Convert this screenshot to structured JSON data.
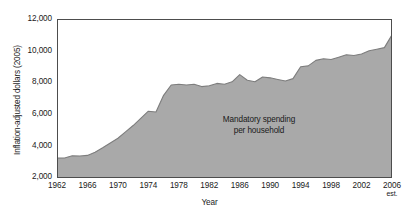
{
  "chart_data": {
    "type": "area",
    "title": "",
    "xlabel": "Year",
    "ylabel": "Inflation-adjusted dollars (2005)",
    "xlim": [
      1962,
      2006
    ],
    "ylim": [
      2000,
      12000
    ],
    "grid": false,
    "legend": "none",
    "fill_color": "#a9a9a9",
    "line_color": "#7d7d7d",
    "axis_color": "#4d4d4d",
    "background": "#ffffff",
    "yticks": [
      "12,000",
      "10,000",
      "8,000",
      "6,000",
      "4,000",
      "2,000"
    ],
    "ytick_values": [
      12000,
      10000,
      8000,
      6000,
      4000,
      2000
    ],
    "xticks": [
      "1962",
      "1966",
      "1970",
      "1974",
      "1978",
      "1982",
      "1986",
      "1990",
      "1994",
      "1998",
      "2002",
      "2006"
    ],
    "xtick_values": [
      1962,
      1966,
      1970,
      1974,
      1978,
      1982,
      1986,
      1990,
      1994,
      1998,
      2002,
      2006
    ],
    "xtick_last_note": "est.",
    "annotation": {
      "line1": "Mandatory spending",
      "line2": "per household"
    },
    "x": [
      1962,
      1963,
      1964,
      1965,
      1966,
      1967,
      1968,
      1969,
      1970,
      1971,
      1972,
      1973,
      1974,
      1975,
      1976,
      1977,
      1978,
      1979,
      1980,
      1981,
      1982,
      1983,
      1984,
      1985,
      1986,
      1987,
      1988,
      1989,
      1990,
      1991,
      1992,
      1993,
      1994,
      1995,
      1996,
      1997,
      1998,
      1999,
      2000,
      2001,
      2002,
      2003,
      2004,
      2005,
      2006
    ],
    "values": [
      3250,
      3260,
      3400,
      3380,
      3420,
      3620,
      3900,
      4200,
      4500,
      4900,
      5300,
      5750,
      6200,
      6150,
      7200,
      7850,
      7900,
      7850,
      7900,
      7750,
      7800,
      7950,
      7900,
      8050,
      8500,
      8150,
      8050,
      8350,
      8300,
      8200,
      8100,
      8250,
      9000,
      9050,
      9400,
      9500,
      9450,
      9600,
      9750,
      9700,
      9800,
      10000,
      10100,
      10200,
      11000
    ],
    "series_name": "Mandatory spending per household"
  }
}
